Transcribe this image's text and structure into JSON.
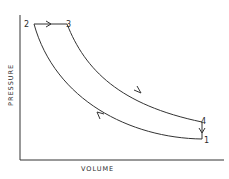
{
  "diagram": {
    "type": "pressure-volume cycle",
    "axes": {
      "xlabel": "VOLUME",
      "ylabel": "PRESSURE"
    },
    "points": [
      {
        "id": "1",
        "label": "1"
      },
      {
        "id": "2",
        "label": "2"
      },
      {
        "id": "3",
        "label": "3"
      },
      {
        "id": "4",
        "label": "4"
      }
    ],
    "processes": [
      {
        "from": "2",
        "to": "3",
        "kind": "constant pressure",
        "direction": "right"
      },
      {
        "from": "3",
        "to": "4",
        "kind": "expansion curve",
        "direction": "down-right"
      },
      {
        "from": "4",
        "to": "1",
        "kind": "constant volume",
        "direction": "down"
      },
      {
        "from": "1",
        "to": "2",
        "kind": "compression curve",
        "direction": "up-left"
      }
    ],
    "stroke_color": "#333333"
  }
}
